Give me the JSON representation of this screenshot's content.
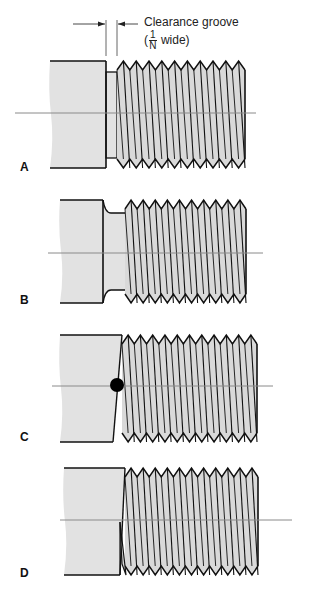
{
  "figure": {
    "callout": {
      "label": "Clearance groove",
      "paren_open": "(",
      "fraction_numerator": "1",
      "fraction_denominator": "N",
      "suffix": " wide)"
    },
    "colors": {
      "body_fill": "#e2e2e2",
      "thread_fill": "#d9d9d9",
      "outline": "#111111",
      "centerline": "#8a8a8a",
      "ball": "#000000"
    },
    "panels": [
      {
        "label": "A",
        "description": "Thread with rectangular clearance groove of 1/N width",
        "label_pos": [
          20,
          160
        ],
        "body": {
          "x0": 50,
          "x1": 106,
          "top": 61,
          "bottom": 168
        },
        "groove": {
          "type": "rect",
          "x0": 106,
          "x1": 117,
          "top": 72,
          "bottom": 158
        },
        "threads": {
          "x0": 117,
          "x1": 245,
          "top_peak": 61,
          "top_valley": 70,
          "bot_peak": 168,
          "bot_valley": 159,
          "pitch": 13
        },
        "centerline": {
          "y": 113,
          "x0": 15,
          "x1": 256
        }
      },
      {
        "label": "B",
        "description": "Thread with rounded undercut groove",
        "label_pos": [
          20,
          293
        ],
        "body": {
          "x0": 60,
          "x1": 103,
          "top": 200,
          "bottom": 303
        },
        "groove": {
          "type": "round",
          "x0": 103,
          "x1": 125,
          "top": 213,
          "bottom": 290
        },
        "threads": {
          "x0": 125,
          "x1": 246,
          "top_peak": 200,
          "top_valley": 209,
          "bot_peak": 303,
          "bot_valley": 294,
          "pitch": 12.5
        },
        "centerline": {
          "y": 253,
          "x0": 48,
          "x1": 263
        }
      },
      {
        "label": "C",
        "description": "Thread run-out ending with drilled ball relief",
        "label_pos": [
          20,
          430
        ],
        "body": {
          "x0": 60,
          "x1": 122,
          "x1_bottom": 113,
          "top": 335,
          "bottom": 442
        },
        "ball": {
          "cx": 117,
          "cy": 385,
          "r": 7
        },
        "threads": {
          "x0": 122,
          "x1": 257,
          "top_peak": 335,
          "top_valley": 344,
          "bot_peak": 442,
          "bot_valley": 433,
          "pitch": 12.5
        },
        "centerline": {
          "y": 386,
          "x0": 52,
          "x1": 273
        }
      },
      {
        "label": "D",
        "description": "Thread run-out with vanishing thread",
        "label_pos": [
          20,
          566
        ],
        "body": {
          "x0": 64,
          "x1": 125,
          "x1_bottom": 120,
          "top": 468,
          "bottom": 575
        },
        "vanish": {
          "x": 120,
          "y": 522
        },
        "threads": {
          "x0": 125,
          "x1": 258,
          "top_peak": 468,
          "top_valley": 477,
          "bot_peak": 575,
          "bot_valley": 566,
          "pitch": 12.5
        },
        "centerline": {
          "y": 520,
          "x0": 60,
          "x1": 292
        }
      }
    ],
    "dimension": {
      "ext_left_x": 106,
      "ext_right_x": 117,
      "ext_top": 20,
      "ext_bottom": 56,
      "arrow_y": 24,
      "left_start": 73,
      "right_end": 138
    }
  }
}
